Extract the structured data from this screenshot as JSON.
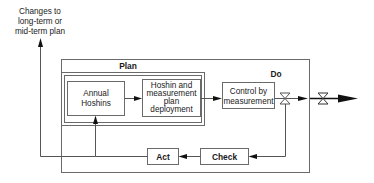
{
  "diagram": {
    "type": "flow",
    "top_note": {
      "line1": "Changes to",
      "line2": "long-term or",
      "line3": "mid-term plan"
    },
    "groups": {
      "plan": "Plan",
      "do": "Do"
    },
    "nodes": {
      "annual": {
        "line1": "Annual",
        "line2": "Hoshins"
      },
      "deploy": {
        "line1": "Hoshin and",
        "line2": "measurement",
        "line3": "plan",
        "line4": "deployment"
      },
      "control": {
        "line1": "Control by",
        "line2": "measurement"
      },
      "check": {
        "label": "Check"
      },
      "act": {
        "label": "Act"
      }
    },
    "edges": [
      {
        "from": "annual",
        "to": "deploy"
      },
      {
        "from": "deploy",
        "to": "control"
      },
      {
        "from": "control",
        "to": "output",
        "via": "valve"
      },
      {
        "from": "valve",
        "to": "check"
      },
      {
        "from": "check",
        "to": "act"
      },
      {
        "from": "act",
        "to": "annual"
      },
      {
        "from": "act",
        "to": "top_note"
      }
    ],
    "colors": {
      "line": "#555555",
      "box_border": "#6a6a6a",
      "arrow": "#111111"
    }
  }
}
